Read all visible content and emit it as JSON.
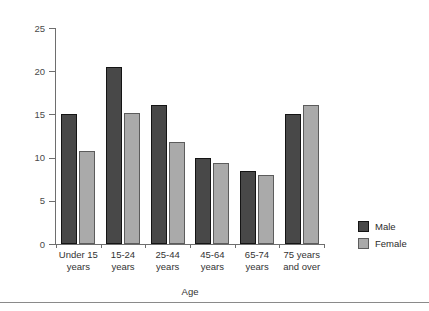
{
  "chart_data": {
    "type": "bar",
    "title": "",
    "xlabel": "Age",
    "ylabel": "Rate per 100 population",
    "ylim": [
      0,
      25
    ],
    "yticks": [
      0,
      5,
      10,
      15,
      20,
      25
    ],
    "ytick_labels": [
      "0",
      "5",
      "10",
      "15",
      "20",
      "25"
    ],
    "grid": false,
    "legend_position": "right",
    "categories": [
      "Under 15\nyears",
      "15-24\nyears",
      "25-44\nyears",
      "45-64\nyears",
      "65-74\nyears",
      "75 years\nand over"
    ],
    "category_lines": [
      [
        "Under 15",
        "years"
      ],
      [
        "15-24",
        "years"
      ],
      [
        "25-44",
        "years"
      ],
      [
        "45-64",
        "years"
      ],
      [
        "65-74",
        "years"
      ],
      [
        "75 years",
        "and over"
      ]
    ],
    "series": [
      {
        "name": "Male",
        "color": "#484848",
        "values": [
          15.0,
          20.5,
          16.1,
          10.0,
          8.4,
          15.0
        ]
      },
      {
        "name": "Female",
        "color": "#aaaaaa",
        "values": [
          10.8,
          15.2,
          11.8,
          9.4,
          8.0,
          16.1
        ]
      }
    ]
  },
  "legend": {
    "items": [
      {
        "label": "Male",
        "swatch": "male"
      },
      {
        "label": "Female",
        "swatch": "female"
      }
    ]
  },
  "axes": {
    "y_title": "Rate per 100 population",
    "x_title": "Age"
  }
}
